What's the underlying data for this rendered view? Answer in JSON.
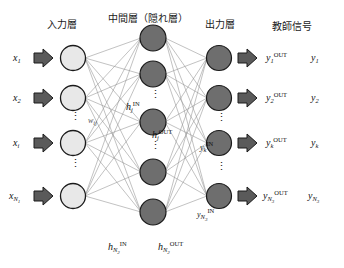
{
  "diagram": {
    "headers": {
      "input_layer": "入力層",
      "hidden_layer": "中間層（隠れ層）",
      "output_layer": "出力層",
      "teacher_signal": "教師信号"
    },
    "colors": {
      "input_node_fill": "#e8e8e8",
      "hidden_node_fill": "#6e6e6e",
      "output_node_fill": "#6e6e6e",
      "node_stroke": "#1a1a1a",
      "arrow_fill": "#5a5a5a",
      "arrow_stroke": "#1a1a1a",
      "connection_line": "#8a8a8a",
      "text": "#111111",
      "background": "#ffffff"
    },
    "input_layer": {
      "node_count": 4,
      "labels": [
        {
          "base": "x",
          "sub": "1",
          "sup": ""
        },
        {
          "base": "x",
          "sub": "2",
          "sup": ""
        },
        {
          "base": "x",
          "sub": "i",
          "sup": ""
        },
        {
          "base": "x",
          "sub": "N",
          "sub2": "1",
          "sup": ""
        }
      ],
      "ellipsis_after": [
        2,
        3
      ]
    },
    "hidden_layer": {
      "node_count": 5,
      "center_label_in": {
        "base": "h",
        "sub": "j",
        "sup": "IN"
      },
      "center_label_out": {
        "base": "h",
        "sub": "j",
        "sup": "OUT"
      },
      "weight_label": {
        "base": "w",
        "sub": "ij"
      },
      "bottom_label_in": {
        "base": "h",
        "sub": "N",
        "sub2": "2",
        "sup": "IN"
      },
      "bottom_label_out": {
        "base": "h",
        "sub": "N",
        "sub2": "2",
        "sup": "OUT"
      },
      "ellipsis_after": [
        2,
        3
      ]
    },
    "output_layer": {
      "node_count": 4,
      "node_in_labels": [
        {
          "base": "y",
          "sub": "k",
          "sup": "IN"
        },
        {
          "base": "y",
          "sub": "N",
          "sub2": "3",
          "sup": "IN"
        }
      ],
      "out_labels": [
        {
          "base": "y",
          "sub": "1",
          "sup": "OUT"
        },
        {
          "base": "y",
          "sub": "2",
          "sup": "OUT"
        },
        {
          "base": "y",
          "sub": "k",
          "sup": "OUT"
        },
        {
          "base": "y",
          "sub": "N",
          "sub2": "3",
          "sup": "OUT"
        }
      ],
      "teacher_labels": [
        {
          "base": "y",
          "sub": "1"
        },
        {
          "base": "y",
          "sub": "2"
        },
        {
          "base": "y",
          "sub": "k"
        },
        {
          "base": "y",
          "sub": "N",
          "sub2": "3"
        }
      ],
      "ellipsis_after": [
        2,
        3
      ]
    },
    "text_labels": {
      "hdr_input": "入力層",
      "hdr_hidden": "中間層（隠れ層）",
      "hdr_output": "出力層",
      "hdr_teacher": "教師信号",
      "x1": "x",
      "x1_sub": "1",
      "x2": "x",
      "x2_sub": "2",
      "xi": "x",
      "xi_sub": "i",
      "xN": "x",
      "xN_sub": "N",
      "xN_sub2": "1",
      "hj_in_base": "h",
      "hj_in_sub": "j",
      "hj_in_sup": "IN",
      "hj_out_base": "h",
      "hj_out_sub": "j",
      "hj_out_sup": "OUT",
      "wij_base": "w",
      "wij_sub": "ij",
      "hN_in_base": "h",
      "hN_in_sub": "N",
      "hN_in_sub2": "2",
      "hN_in_sup": "IN",
      "hN_out_base": "h",
      "hN_out_sub": "N",
      "hN_out_sub2": "2",
      "hN_out_sup": "OUT",
      "yk_in_base": "y",
      "yk_in_sub": "k",
      "yk_in_sup": "IN",
      "yN_in_base": "y",
      "yN_in_sub": "N",
      "yN_in_sub2": "3",
      "yN_in_sup": "IN",
      "y1_out_base": "y",
      "y1_out_sub": "1",
      "y1_out_sup": "OUT",
      "y2_out_base": "y",
      "y2_out_sub": "2",
      "y2_out_sup": "OUT",
      "yk_out_base": "y",
      "yk_out_sub": "k",
      "yk_out_sup": "OUT",
      "yN_out_base": "y",
      "yN_out_sub": "N",
      "yN_out_sub2": "3",
      "yN_out_sup": "OUT",
      "t1_base": "y",
      "t1_sub": "1",
      "t2_base": "y",
      "t2_sub": "2",
      "tk_base": "y",
      "tk_sub": "k",
      "tN_base": "y",
      "tN_sub": "N",
      "tN_sub2": "3",
      "dots": "⋮"
    }
  }
}
